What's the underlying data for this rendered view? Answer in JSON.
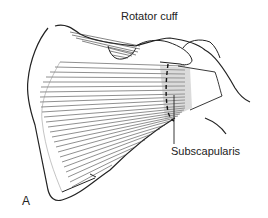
{
  "figure": {
    "panel_label": "A",
    "labels": {
      "rotator_cuff": "Rotator cuff",
      "subscapularis": "Subscapularis"
    },
    "colors": {
      "ink": "#222222",
      "background": "#ffffff",
      "shade": "#999999"
    }
  }
}
